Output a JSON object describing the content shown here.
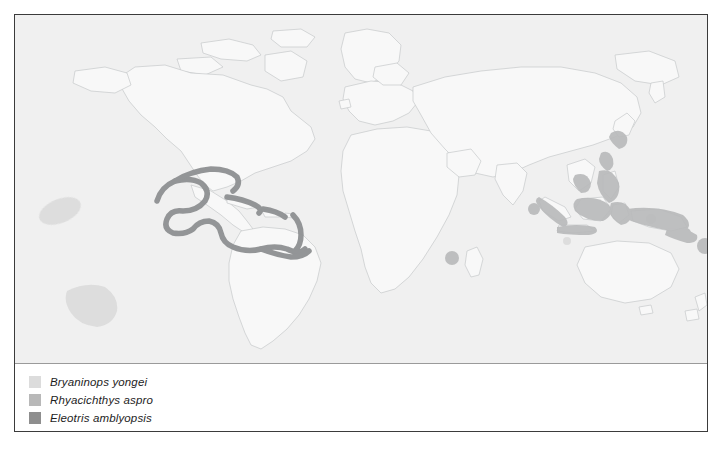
{
  "figure": {
    "kind": "species-distribution-map",
    "border_color": "#3b3b3b"
  },
  "map": {
    "projection": "world-equirectangular",
    "ocean_color": "#f0f0f0",
    "land_color": "#f7f7f7",
    "coastline_color": "#c3c6c9",
    "ranges": [
      {
        "species": "Bryaninops yongei",
        "color": "#dcdcdc",
        "regions": [
          "Eastern Pacific blob (north)",
          "Eastern Pacific blob (south)",
          "Indo-Pacific scattered islands"
        ]
      },
      {
        "species": "Rhyacichthys aspro",
        "color": "#b8b8b8",
        "regions": [
          "Indonesia",
          "Philippines",
          "New Guinea",
          "Taiwan / Ryukyu",
          "Indian Ocean islands",
          "Melanesia"
        ]
      },
      {
        "species": "Eleotris amblyopsis",
        "color": "#8e8e8e",
        "regions": [
          "Gulf of Mexico coast",
          "Caribbean Sea",
          "Greater Antilles",
          "Lesser Antilles",
          "Northern South America"
        ]
      }
    ]
  },
  "legend": {
    "items": [
      {
        "label": "Bryaninops yongei",
        "color": "#dcdcdc"
      },
      {
        "label": "Rhyacichthys aspro",
        "color": "#b8b8b8"
      },
      {
        "label": "Eleotris amblyopsis",
        "color": "#8e8e8e"
      }
    ]
  }
}
